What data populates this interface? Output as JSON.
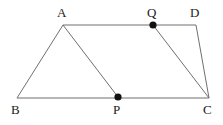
{
  "figure": {
    "canvas": {
      "width": 223,
      "height": 125
    },
    "background_color": "#ffffff",
    "line_color": "#6f6f6f",
    "point_color": "#111111",
    "label_color": "#1a1a1a",
    "vertices": [
      {
        "id": "A",
        "label": "A",
        "x": 63,
        "y": 25,
        "label_x": 57,
        "label_y": 6,
        "marked": false
      },
      {
        "id": "B",
        "label": "B",
        "x": 17,
        "y": 98,
        "label_x": 11,
        "label_y": 103,
        "marked": false
      },
      {
        "id": "C",
        "label": "C",
        "x": 209,
        "y": 98,
        "label_x": 203,
        "label_y": 103,
        "marked": false
      },
      {
        "id": "D",
        "label": "D",
        "x": 196,
        "y": 25,
        "label_x": 190,
        "label_y": 6,
        "marked": false
      },
      {
        "id": "P",
        "label": "P",
        "x": 118,
        "y": 97,
        "label_x": 113,
        "label_y": 103,
        "marked": true
      },
      {
        "id": "Q",
        "label": "Q",
        "x": 153,
        "y": 25,
        "label_x": 147,
        "label_y": 6,
        "marked": true
      }
    ],
    "edges": [
      {
        "id": "AD",
        "from": "A",
        "to": "D",
        "x1": 63,
        "y1": 25,
        "x2": 196,
        "y2": 25
      },
      {
        "id": "BC",
        "from": "B",
        "to": "C",
        "x1": 17,
        "y1": 98,
        "x2": 209,
        "y2": 98
      },
      {
        "id": "AB",
        "from": "A",
        "to": "B",
        "x1": 63,
        "y1": 25,
        "x2": 17,
        "y2": 98
      },
      {
        "id": "AP",
        "from": "A",
        "to": "P",
        "x1": 63,
        "y1": 25,
        "x2": 118,
        "y2": 97
      },
      {
        "id": "QC",
        "from": "Q",
        "to": "C",
        "x1": 153,
        "y1": 25,
        "x2": 209,
        "y2": 98
      },
      {
        "id": "DC",
        "from": "D",
        "to": "C",
        "x1": 196,
        "y1": 25,
        "x2": 209,
        "y2": 98
      }
    ],
    "marked_points": [
      {
        "id": "P",
        "x": 118,
        "y": 97,
        "radius": 3.6
      },
      {
        "id": "Q",
        "x": 153,
        "y": 25,
        "radius": 3.6
      }
    ]
  }
}
